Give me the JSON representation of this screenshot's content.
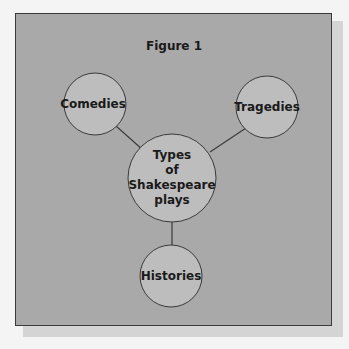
{
  "figure": {
    "title": "Figure 1",
    "center_node": {
      "label": "Types of Shakespeare plays",
      "lines": [
        "Types",
        "of",
        "Shakespeare",
        "plays"
      ]
    },
    "nodes": [
      {
        "id": "comedies",
        "label": "Comedies"
      },
      {
        "id": "tragedies",
        "label": "Tragedies"
      },
      {
        "id": "histories",
        "label": "Histories"
      }
    ]
  },
  "colors": {
    "panel": "#a9a9a9",
    "circle_fill": "#bdbdbd",
    "stroke": "#3a3a3a",
    "shadow": "#d4d4d4"
  }
}
